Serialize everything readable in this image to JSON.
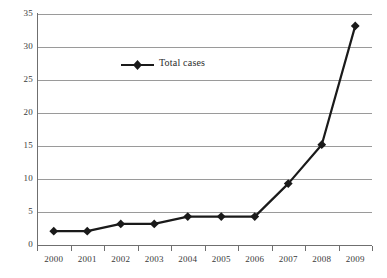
{
  "chart_data": {
    "type": "line",
    "title": "",
    "subtitle": "",
    "xlabel": "",
    "ylabel": "",
    "categories": [
      "2000",
      "2001",
      "2002",
      "2003",
      "2004",
      "2005",
      "2006",
      "2007",
      "2008",
      "2009"
    ],
    "series": [
      {
        "name": "Total cases",
        "marker": "diamond",
        "color": "#1a1a1a",
        "values": [
          2.1,
          2.1,
          3.2,
          3.2,
          4.3,
          4.3,
          4.3,
          9.3,
          15.2,
          33.2
        ]
      }
    ],
    "ylim": [
      0,
      35
    ],
    "yticks": [
      0,
      5,
      10,
      15,
      20,
      25,
      30,
      35
    ],
    "ytick_labels": [
      "0",
      "5",
      "10",
      "15",
      "20",
      "25",
      "30",
      "35"
    ],
    "xtick_labels": [
      "2000",
      "2001",
      "2002",
      "2003",
      "2004",
      "2005",
      "2006",
      "2007",
      "2008",
      "2009"
    ],
    "grid": "horizontal",
    "grid_color": "#9a9a9a",
    "legend_position": "inside-top-left",
    "background": "#ffffff",
    "axis_color": "#6f6f6f"
  },
  "legend": {
    "entries": [
      {
        "label": "Total cases",
        "color": "#1a1a1a",
        "marker": "diamond"
      }
    ]
  },
  "axes": {
    "y": {
      "labels": [
        "35",
        "30",
        "25",
        "20",
        "15",
        "10",
        "5",
        "0"
      ]
    },
    "x": {
      "labels": [
        "2000",
        "2001",
        "2002",
        "2003",
        "2004",
        "2005",
        "2006",
        "2007",
        "2008",
        "2009"
      ]
    }
  }
}
